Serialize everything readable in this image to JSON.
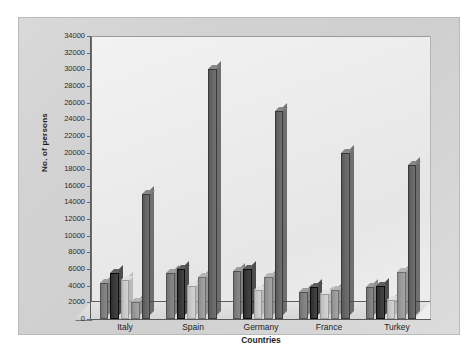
{
  "chart_data": {
    "type": "bar",
    "title": "",
    "subtitle": "",
    "xlabel": "Countries",
    "ylabel": "No. of persons",
    "categories": [
      "Italy",
      "Spain",
      "Germany",
      "France",
      "Turkey"
    ],
    "ylim": [
      0,
      34000
    ],
    "ytick_step": 2000,
    "yticks": [
      "34000",
      "32000",
      "30000",
      "28000",
      "26000",
      "24000",
      "22000",
      "20000",
      "18000",
      "16000",
      "14000",
      "12000",
      "10000",
      "8000",
      "6000",
      "4000",
      "2000",
      "0"
    ],
    "grid": false,
    "legend": "none",
    "style": "3d-grayscale",
    "series": [
      {
        "name": "Series 1",
        "color": "#7f7f7f",
        "values": [
          4300,
          5500,
          5800,
          3300,
          3800
        ]
      },
      {
        "name": "Series 2",
        "color": "#3a3a3a",
        "values": [
          5500,
          6000,
          6000,
          3800,
          4000
        ]
      },
      {
        "name": "Series 3",
        "color": "#c9c9c9",
        "values": [
          4700,
          4000,
          3500,
          3000,
          2300
        ]
      },
      {
        "name": "Series 4",
        "color": "#9a9a9a",
        "values": [
          2000,
          5000,
          5000,
          3500,
          5700
        ]
      },
      {
        "name": "Series 5",
        "color": "#666666",
        "values": [
          15000,
          30000,
          25000,
          20000,
          18500
        ]
      }
    ]
  },
  "frame": {
    "card_bg": "#d6d6d6",
    "plot_bg": "#ededed",
    "axis_color": "#5a5a5a"
  }
}
